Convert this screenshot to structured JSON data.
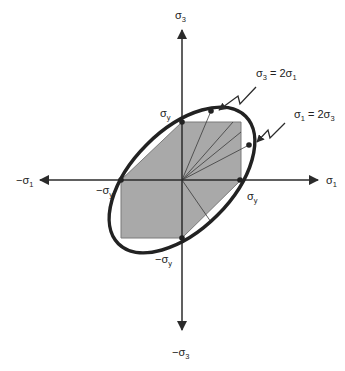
{
  "diagram": {
    "colors": {
      "background": "#ffffff",
      "axis": "#2b2b2b",
      "ellipse": "#222222",
      "hexagon_fill": "#a9a9a9",
      "hexagon_stroke": "#7a7a7a"
    },
    "axes": {
      "pos_x": {
        "base": "σ",
        "sub": "1",
        "sign": ""
      },
      "neg_x": {
        "base": "σ",
        "sub": "1",
        "sign": "−"
      },
      "pos_y": {
        "base": "σ",
        "sub": "3",
        "sign": ""
      },
      "neg_y": {
        "base": "σ",
        "sub": "3",
        "sign": "−"
      }
    },
    "intercept_labels": {
      "top": {
        "base": "σ",
        "sub": "y",
        "sign": ""
      },
      "right": {
        "base": "σ",
        "sub": "y",
        "sign": ""
      },
      "left": {
        "base": "σ",
        "sub": "y",
        "sign": "−"
      },
      "bottom": {
        "base": "σ",
        "sub": "y",
        "sign": "−"
      }
    },
    "annotations": [
      {
        "id": "s3_eq_2s1",
        "text_parts": [
          "σ",
          "3",
          " = 2σ",
          "1"
        ]
      },
      {
        "id": "s1_eq_2s3",
        "text_parts": [
          "σ",
          "1",
          " = 2σ",
          "3"
        ]
      }
    ],
    "shapes": {
      "outer": "von Mises ellipse",
      "inner": "Tresca hexagon"
    }
  }
}
